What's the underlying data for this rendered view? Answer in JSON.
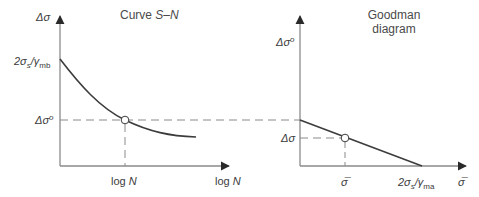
{
  "left_panel": {
    "title_prefix": "Curve ",
    "title_italic": "S–N",
    "y_axis_label": "Δσ",
    "y_tick_top": {
      "base": "2σ",
      "sub1": "s",
      "mid": "/γ",
      "sub2": "mb"
    },
    "y_tick_mid": {
      "base": "Δσ",
      "sup": "o"
    },
    "x_tick": {
      "prefix": "log ",
      "italic": "N"
    },
    "x_axis_label": {
      "prefix": "log ",
      "italic": "N"
    }
  },
  "right_panel": {
    "title_line1": "Goodman",
    "title_line2": "diagram",
    "y_axis_label": {
      "base": "Δσ",
      "sup": "o"
    },
    "y_tick": "Δσ",
    "x_tick_mid": "σ̅",
    "x_tick_end": {
      "base": "2σ",
      "sub1": "s",
      "mid": "/γ",
      "sub2": "ma"
    },
    "x_axis_label": "σ̅"
  },
  "colors": {
    "axis": "#8a8a8a",
    "curve": "#3c3c3c",
    "dash": "#8a8a8a",
    "text": "#3a3a3a"
  }
}
